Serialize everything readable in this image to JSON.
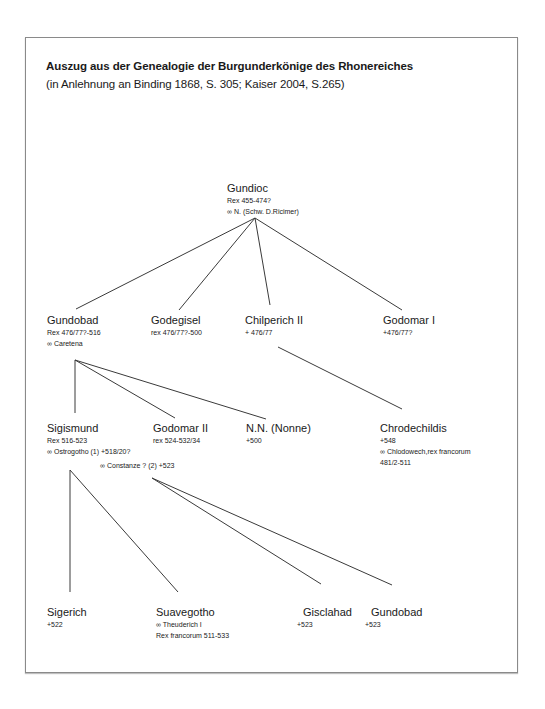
{
  "title": "Auszug aus der Genealogie der Burgunderkönige des Rhonereiches",
  "subtitle": "(in Anlehnung an Binding 1868, S. 305; Kaiser 2004, S.265)",
  "marriage_symbol": "∞",
  "nodes": {
    "gundioc": {
      "name": "Gundioc",
      "lines": [
        "Rex 455-474?",
        "∞ N. (Schw. D.Ricimer)"
      ]
    },
    "gundobad": {
      "name": "Gundobad",
      "lines": [
        "Rex 476/77?-516",
        "∞  Caretena"
      ]
    },
    "godegisel": {
      "name": "Godegisel",
      "lines": [
        "rex 476/77?-500"
      ]
    },
    "chilperich": {
      "name": "Chilperich II",
      "lines": [
        "+ 476/77"
      ]
    },
    "godomar1": {
      "name": "Godomar I",
      "lines": [
        "+476/77?"
      ]
    },
    "sigismund": {
      "name": "Sigismund",
      "lines": [
        "Rex 516-523",
        "∞ Ostrogotho (1)  +518/20?"
      ]
    },
    "constanze": {
      "line": "∞ Constanze ? (2)  +523"
    },
    "godomar2": {
      "name": "Godomar II",
      "lines": [
        "rex 524-532/34"
      ]
    },
    "nn_nonne": {
      "name": "N.N. (Nonne)",
      "lines": [
        "+500"
      ]
    },
    "chrodechildis": {
      "name": "Chrodechildis",
      "lines": [
        "+548",
        "∞  Chlodowech,rex francorum",
        "481/2-511"
      ]
    },
    "sigerich": {
      "name": "Sigerich",
      "lines": [
        "+522"
      ]
    },
    "suavegotho": {
      "name": "Suavegotho",
      "lines": [
        "∞  Theuderich  I",
        "Rex francorum 511-533"
      ]
    },
    "gisclahad": {
      "name": "Gisclahad",
      "lines": [
        "+523"
      ]
    },
    "gundobad2": {
      "name": "Gundobad",
      "lines": [
        "+523"
      ]
    }
  },
  "edges": [
    {
      "from": "gundioc",
      "to": "gundobad"
    },
    {
      "from": "gundioc",
      "to": "godegisel"
    },
    {
      "from": "gundioc",
      "to": "chilperich"
    },
    {
      "from": "gundioc",
      "to": "godomar1"
    },
    {
      "from": "gundobad",
      "to": "sigismund"
    },
    {
      "from": "gundobad",
      "to": "godomar2"
    },
    {
      "from": "gundobad",
      "to": "nn_nonne"
    },
    {
      "from": "chilperich",
      "to": "chrodechildis"
    },
    {
      "from": "sigismund (Ostrogotho)",
      "to": "sigerich"
    },
    {
      "from": "sigismund (Ostrogotho)",
      "to": "suavegotho"
    },
    {
      "from": "sigismund (Constanze)",
      "to": "gisclahad"
    },
    {
      "from": "sigismund (Constanze)",
      "to": "gundobad2"
    }
  ]
}
